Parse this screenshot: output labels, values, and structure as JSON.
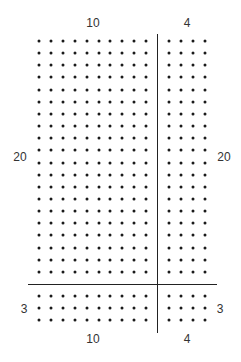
{
  "diagram": {
    "title": "",
    "labels": {
      "top_left": "10",
      "top_right": "4",
      "left_upper": "20",
      "right_upper": "20",
      "left_lower": "3",
      "right_lower": "3",
      "bottom_left": "10",
      "bottom_right": "4"
    },
    "grid": {
      "left_columns": 10,
      "right_columns": 4,
      "upper_rows": 20,
      "lower_rows": 3,
      "dot_color": "#1a1a1a",
      "line_color": "#222222"
    },
    "regions": [
      {
        "name": "upper-left",
        "rows": 20,
        "cols": 10,
        "product": 200
      },
      {
        "name": "upper-right",
        "rows": 20,
        "cols": 4,
        "product": 80
      },
      {
        "name": "lower-left",
        "rows": 3,
        "cols": 10,
        "product": 30
      },
      {
        "name": "lower-right",
        "rows": 3,
        "cols": 4,
        "product": 12
      }
    ]
  }
}
